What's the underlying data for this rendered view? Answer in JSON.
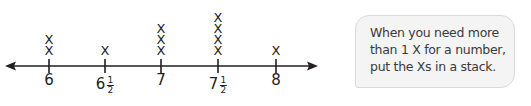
{
  "chart_data": {
    "type": "line_plot",
    "title": "",
    "xlabel": "",
    "ylabel": "",
    "categories": [
      "6",
      "6 1/2",
      "7",
      "7 1/2",
      "8"
    ],
    "values": [
      2,
      1,
      3,
      4,
      1
    ],
    "marker": "X",
    "axis_range": [
      6,
      8
    ],
    "arrows_both_ends": true,
    "grid": false,
    "legend": null
  },
  "plot": {
    "ticks": [
      {
        "whole": "6",
        "num": "",
        "den": "",
        "x": 49,
        "count": 2
      },
      {
        "whole": "6",
        "num": "1",
        "den": "2",
        "x": 105,
        "count": 1
      },
      {
        "whole": "7",
        "num": "",
        "den": "",
        "x": 161,
        "count": 3
      },
      {
        "whole": "7",
        "num": "1",
        "den": "2",
        "x": 218,
        "count": 4
      },
      {
        "whole": "8",
        "num": "",
        "den": "",
        "x": 276,
        "count": 1
      }
    ],
    "mark_symbol": "X"
  },
  "callout": {
    "lines": [
      "When you need more",
      "than 1 X for a number,",
      "put the Xs in a stack."
    ]
  },
  "colors": {
    "ink": "#231f20",
    "bubble_fill": "#f4f4f4",
    "bubble_border": "#d9d9d9"
  }
}
